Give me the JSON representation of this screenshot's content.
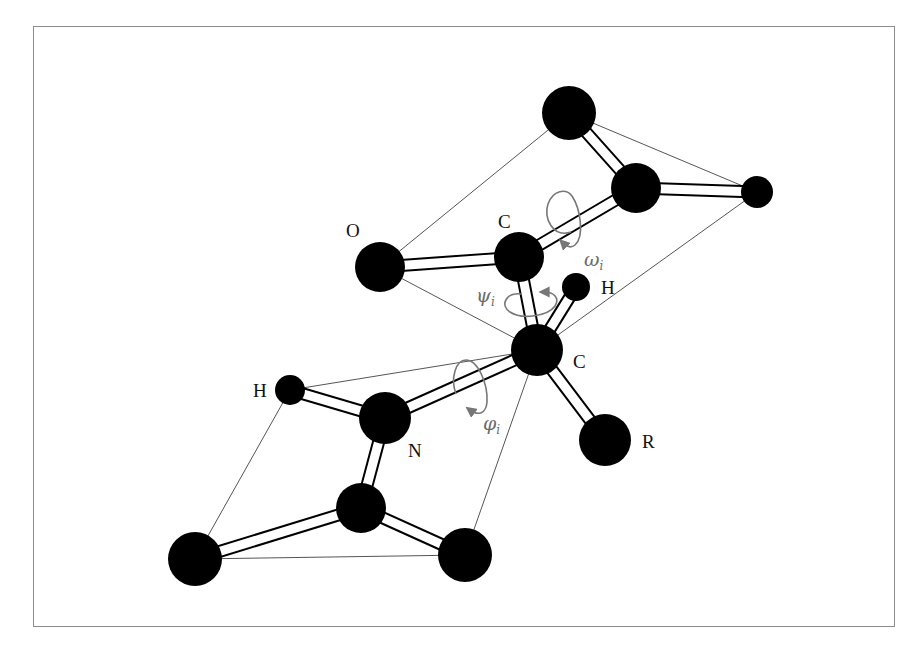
{
  "diagram": {
    "labels": {
      "O": "O",
      "C_carbonyl": "C",
      "H_alpha": "H",
      "C_alpha": "C",
      "H_amide": "H",
      "N": "N",
      "R": "R"
    },
    "angles": {
      "omega": {
        "symbol": "ω",
        "subscript": "i"
      },
      "psi": {
        "symbol": "ψ",
        "subscript": "i"
      },
      "phi": {
        "symbol": "φ",
        "subscript": "i"
      }
    },
    "colors": {
      "atom": "#000000",
      "bond_fill": "#ffffff",
      "plane_line": "#555555",
      "rotation_arrow": "#777777",
      "frame": "#8c8c8c"
    }
  }
}
